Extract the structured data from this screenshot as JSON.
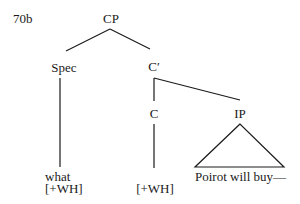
{
  "example_label": "70b",
  "tree": {
    "root": {
      "label": "CP"
    },
    "spec": {
      "label": "Spec",
      "word": "what",
      "feature": "[+WH]"
    },
    "cbar": {
      "label": "C′"
    },
    "c": {
      "label": "C",
      "feature": "[+WH]"
    },
    "ip": {
      "label": "IP",
      "content": "Poirot will buy—"
    }
  },
  "colors": {
    "line": "#1a1a1a",
    "text": "#1a1a1a",
    "background": "#ffffff"
  }
}
